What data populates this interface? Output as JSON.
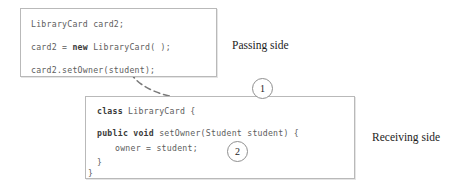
{
  "diagram": {
    "passing_box": {
      "name": "passing-side-code-box",
      "lines": [
        {
          "id": "pl0",
          "segments": [
            {
              "text": "LibraryCard card2;",
              "bold": false
            }
          ]
        },
        {
          "id": "pl1",
          "segments": [
            {
              "text": "card2 = ",
              "bold": false
            },
            {
              "text": "new",
              "bold": true
            },
            {
              "text": " LibraryCard( );",
              "bold": false
            }
          ]
        },
        {
          "id": "pl2",
          "segments": [
            {
              "text": "card2.setOwner(student);",
              "bold": false
            }
          ]
        }
      ]
    },
    "receiving_box": {
      "name": "receiving-side-code-box",
      "lines": [
        {
          "id": "rl0",
          "segments": [
            {
              "text": "class",
              "bold": true
            },
            {
              "text": " LibraryCard {",
              "bold": false
            }
          ]
        },
        {
          "id": "rl1",
          "segments": [
            {
              "text": "public void",
              "bold": true
            },
            {
              "text": " setOwner(Student student) {",
              "bold": false
            }
          ]
        },
        {
          "id": "rl2",
          "segments": [
            {
              "text": "owner = student;",
              "bold": false
            }
          ]
        },
        {
          "id": "rl3",
          "segments": [
            {
              "text": "}",
              "bold": false
            }
          ]
        },
        {
          "id": "rl4",
          "segments": [
            {
              "text": "}",
              "bold": false
            }
          ]
        }
      ]
    },
    "labels": {
      "passing_side": "Passing side",
      "receiving_side": "Receiving side"
    },
    "steps": [
      {
        "number": "1",
        "name": "step-marker-1"
      },
      {
        "number": "2",
        "name": "step-marker-2"
      }
    ],
    "colors": {
      "box_border": "#b9b9b9",
      "code_text": "#5d5d5d",
      "keyword_text": "#3a3a3a",
      "label_text": "#1c1c1c",
      "arrow": "#7a7a7a",
      "background": "#ffffff"
    }
  }
}
